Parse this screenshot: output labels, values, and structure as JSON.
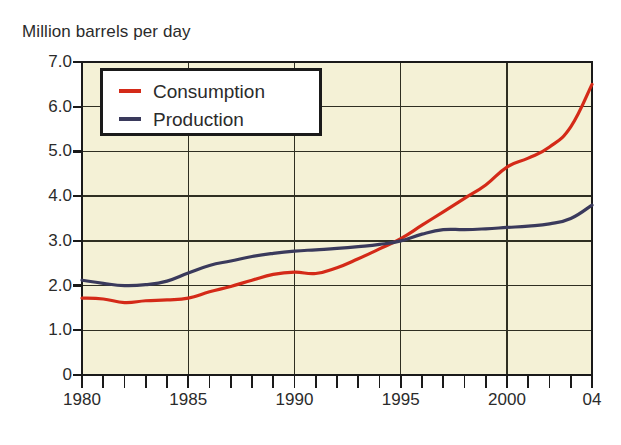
{
  "chart_data": {
    "type": "line",
    "title": "Million barrels per day",
    "xlabel": "",
    "ylabel": "Million barrels per day",
    "xlim": [
      1980,
      2004
    ],
    "ylim": [
      0,
      7
    ],
    "grid": true,
    "legend_position": "top-left",
    "y_ticks": [
      "7.0",
      "6.0",
      "5.0",
      "4.0",
      "3.0",
      "2.0",
      "1.0",
      "0"
    ],
    "y_tick_values": [
      7.0,
      6.0,
      5.0,
      4.0,
      3.0,
      2.0,
      1.0,
      0
    ],
    "x_ticks": [
      "1980",
      "1985",
      "1990",
      "1995",
      "2000",
      "04"
    ],
    "x_tick_values": [
      1980,
      1985,
      1990,
      1995,
      2000,
      2004
    ],
    "x_minor_step": 1,
    "x": [
      1980,
      1981,
      1982,
      1983,
      1984,
      1985,
      1986,
      1987,
      1988,
      1989,
      1990,
      1991,
      1992,
      1993,
      1994,
      1995,
      1996,
      1997,
      1998,
      1999,
      2000,
      2001,
      2002,
      2003,
      2004
    ],
    "series": [
      {
        "name": "Consumption",
        "color": "#d42a18",
        "values": [
          1.72,
          1.7,
          1.62,
          1.66,
          1.68,
          1.72,
          1.86,
          1.98,
          2.12,
          2.25,
          2.3,
          2.27,
          2.4,
          2.6,
          2.82,
          3.05,
          3.35,
          3.65,
          3.95,
          4.25,
          4.65,
          4.85,
          5.1,
          5.55,
          6.5
        ]
      },
      {
        "name": "Production",
        "color": "#3a3a5c",
        "values": [
          2.12,
          2.05,
          2.0,
          2.02,
          2.1,
          2.28,
          2.45,
          2.55,
          2.65,
          2.72,
          2.77,
          2.8,
          2.83,
          2.87,
          2.92,
          3.0,
          3.15,
          3.25,
          3.25,
          3.27,
          3.3,
          3.33,
          3.38,
          3.5,
          3.8
        ]
      }
    ],
    "legend_entries": [
      {
        "label": "Consumption",
        "color": "#d42a18"
      },
      {
        "label": "Production",
        "color": "#3a3a5c"
      }
    ],
    "plot_background": "#f4f1d6",
    "grid_color": "#2f2f22",
    "axis_color": "#1a1a1a"
  }
}
